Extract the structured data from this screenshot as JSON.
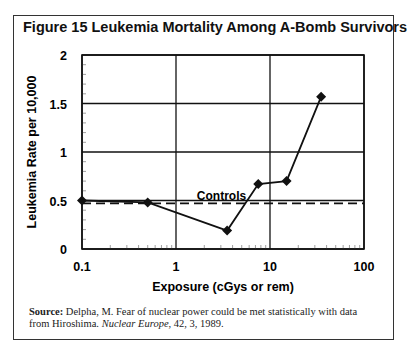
{
  "figure": {
    "title": "Figure 15  Leukemia Mortality Among A-Bomb Survivors",
    "source_label": "Source:",
    "source_text_1": " Delpha, M. Fear of nuclear power could be met statistically with data from Hiroshima. ",
    "source_journal": "Nuclear Europe",
    "source_text_2": ", 42, 3, 1989."
  },
  "chart_data": {
    "type": "line",
    "title": "Figure 15  Leukemia Mortality Among A-Bomb Survivors",
    "xlabel": "Exposure (cGys or rem)",
    "ylabel": "Leukemia Rate per 10,000",
    "xscale": "log",
    "xlim": [
      0.1,
      100
    ],
    "ylim": [
      0,
      2
    ],
    "xticks": [
      "0.1",
      "1",
      "10",
      "100"
    ],
    "yticks": [
      "0",
      "0.5",
      "1",
      "1.5",
      "2"
    ],
    "grid": true,
    "series": [
      {
        "name": "A-Bomb Survivors",
        "marker": "diamond",
        "style": "solid",
        "x": [
          0.1,
          0.5,
          3.5,
          7.5,
          15,
          35
        ],
        "y": [
          0.5,
          0.48,
          0.19,
          0.67,
          0.7,
          1.57
        ]
      },
      {
        "name": "Controls",
        "style": "dashed",
        "x": [
          0.1,
          100
        ],
        "y": [
          0.47,
          0.47
        ]
      }
    ],
    "annotations": [
      {
        "text": "Controls",
        "x": 3.0,
        "y": 0.53
      }
    ]
  }
}
